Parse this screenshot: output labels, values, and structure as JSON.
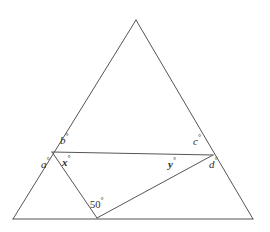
{
  "figure": {
    "type": "geometry-diagram",
    "width": 270,
    "height": 232,
    "background_color": "#ffffff",
    "stroke_color": "#555555",
    "stroke_width": 1,
    "text_color": "#2e2e2e",
    "points": {
      "apex": {
        "name": "apex",
        "x": 136,
        "y": 20
      },
      "base_left": {
        "name": "base-left",
        "x": 13,
        "y": 219
      },
      "base_right": {
        "name": "base-right",
        "x": 253,
        "y": 219
      },
      "left_intersection": {
        "name": "left-intersection",
        "x": 52,
        "y": 152
      },
      "right_intersection": {
        "name": "right-intersection",
        "x": 213,
        "y": 155
      },
      "bottom_vertex": {
        "name": "bottom-vertex",
        "x": 97,
        "y": 218
      }
    },
    "segments": [
      {
        "name": "triangle-left-side",
        "from": "apex",
        "to": "base_left"
      },
      {
        "name": "triangle-right-side",
        "from": "apex",
        "to": "base_right"
      },
      {
        "name": "triangle-base",
        "from": "base_left",
        "to": "base_right"
      },
      {
        "name": "transversal-line",
        "from": "left_intersection",
        "to": "right_intersection"
      },
      {
        "name": "inner-left-segment",
        "from": "left_intersection",
        "to": "bottom_vertex"
      },
      {
        "name": "inner-diagonal-segment",
        "from": "bottom_vertex",
        "to": "right_intersection"
      }
    ]
  },
  "labels": {
    "b": {
      "text": "b",
      "degree": "°",
      "style": "italic",
      "at": "left-intersection-above"
    },
    "a": {
      "text": "a",
      "degree": "°",
      "style": "italic",
      "at": "left-intersection-below-left"
    },
    "x": {
      "text": "x",
      "degree": "°",
      "style": "bold-italic",
      "at": "left-intersection-below-right"
    },
    "c": {
      "text": "c",
      "degree": "°",
      "style": "italic",
      "at": "right-intersection-above-left"
    },
    "y": {
      "text": "y",
      "degree": "°",
      "style": "bold-italic",
      "at": "right-intersection-below-left"
    },
    "d": {
      "text": "d",
      "degree": "°",
      "style": "italic",
      "at": "right-intersection-below-right"
    },
    "fifty": {
      "text": "50",
      "degree": "°",
      "style": "regular",
      "at": "bottom-vertex-above-right"
    }
  }
}
